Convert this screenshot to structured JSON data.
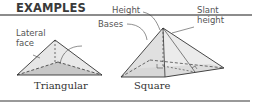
{
  "header": {
    "title": "EXAMPLES"
  },
  "labels": {
    "lateral_face_line1": "Lateral",
    "lateral_face_line2": "face",
    "bases": "Bases",
    "height": "Height",
    "slant_line1": "Slant",
    "slant_line2": "height"
  },
  "captions": {
    "triangular": "Triangular",
    "square": "Square"
  },
  "colors": {
    "rule": "#8c8c8c",
    "face_light": "#e4e4e4",
    "base_fill": "#c9c9c9",
    "edge": "#333333"
  }
}
